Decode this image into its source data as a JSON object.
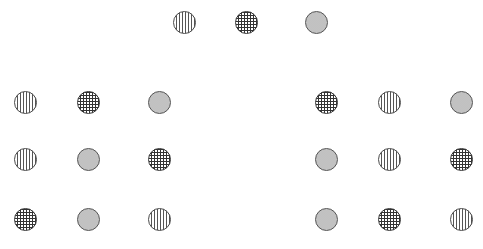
{
  "diagram": {
    "patterns": {
      "vertical": "vertical-stripes",
      "grid": "cross-hatch-grid",
      "dotted": "dotted-gray"
    },
    "top_row": [
      "vertical",
      "grid",
      "dotted"
    ],
    "left_group": [
      [
        "vertical",
        "grid",
        "dotted"
      ],
      [
        "vertical",
        "dotted",
        "grid"
      ],
      [
        "grid",
        "dotted",
        "vertical"
      ]
    ],
    "right_group": [
      [
        "grid",
        "vertical",
        "dotted"
      ],
      [
        "dotted",
        "vertical",
        "grid"
      ],
      [
        "dotted",
        "grid",
        "vertical"
      ]
    ]
  }
}
